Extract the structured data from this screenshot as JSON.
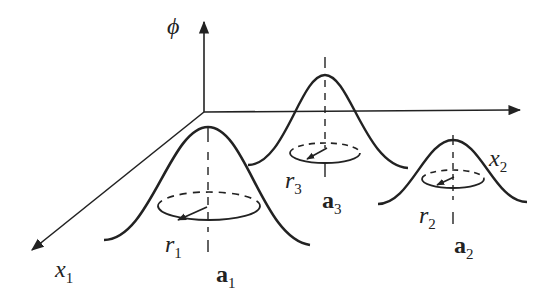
{
  "diagram": {
    "axes": {
      "vertical": {
        "label": "ϕ"
      },
      "x1": {
        "label": "x",
        "sub": "1"
      },
      "x2": {
        "label": "x",
        "sub": "2"
      }
    },
    "bumps": [
      {
        "center_label": "a",
        "center_sub": "1",
        "radius_label": "r",
        "radius_sub": "1"
      },
      {
        "center_label": "a",
        "center_sub": "2",
        "radius_label": "r",
        "radius_sub": "2"
      },
      {
        "center_label": "a",
        "center_sub": "3",
        "radius_label": "r",
        "radius_sub": "3"
      }
    ],
    "colors": {
      "stroke": "#222222",
      "background": "#ffffff"
    }
  }
}
